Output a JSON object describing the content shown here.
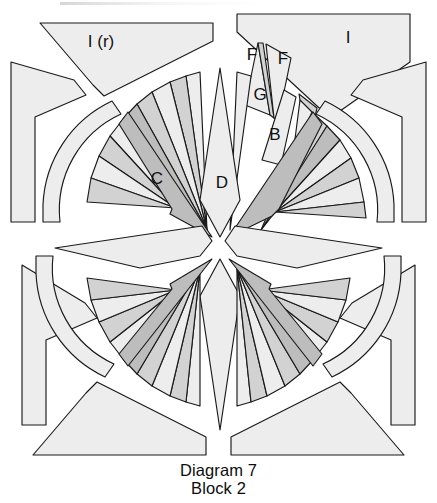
{
  "figure": {
    "title": "Diagram 7",
    "subtitle": "Block 2",
    "kind": "mariners-compass-quilt-block-piecing-diagram"
  },
  "caption": {
    "line1": "Diagram 7",
    "line2": "Block 2"
  },
  "palette": {
    "background": "#ffffff",
    "outline": "#1a1a1a",
    "fill_light": "#ededed",
    "fill_medium": "#d2d2d2",
    "fill_dark": "#bdbdbd",
    "fill_white": "#fbfbfb",
    "label_color": "#111111"
  },
  "labels": [
    {
      "id": "label-i-r",
      "text": "I (r)",
      "x": 101,
      "y": 43,
      "note": "top-left corner triangle, reversed"
    },
    {
      "id": "label-i",
      "text": "I",
      "x": 348,
      "y": 39,
      "note": "top-right corner triangle"
    },
    {
      "id": "label-f-1",
      "text": "F",
      "x": 252,
      "y": 56,
      "note": "left small spike, upper tier"
    },
    {
      "id": "label-f-2",
      "text": "F",
      "x": 283,
      "y": 60,
      "note": "right small spike, upper tier"
    },
    {
      "id": "label-g",
      "text": "G",
      "x": 260,
      "y": 96,
      "note": "narrow center sliver spike"
    },
    {
      "id": "label-b",
      "text": "B",
      "x": 275,
      "y": 136,
      "note": "second tier wedge"
    },
    {
      "id": "label-c",
      "text": "C",
      "x": 157,
      "y": 180,
      "note": "large dark kite, upper-left point"
    },
    {
      "id": "label-d",
      "text": "D",
      "x": 222,
      "y": 184,
      "note": "main vertical star point"
    }
  ],
  "structure": {
    "quadrants": 4,
    "spikes_per_quadrant": 9,
    "main_star_points": 4,
    "corner_triangles": 4,
    "arc_bands": 4,
    "center": {
      "x": 220,
      "y": 248
    }
  }
}
